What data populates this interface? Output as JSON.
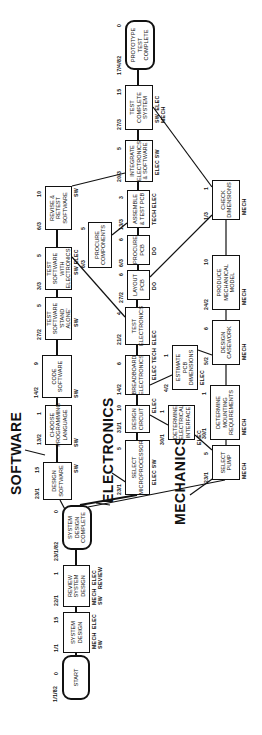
{
  "sections": {
    "software": "SOFTWARE",
    "electronics": "ELECTRONICS",
    "mechanics": "MECHANICS"
  },
  "start_date": "1/1/82",
  "nodes": {
    "start": {
      "label": "START",
      "date": "",
      "duration": "0",
      "resources": ""
    },
    "system_design": {
      "label": "SYSTEM\nDESIGN",
      "date": "1/1",
      "duration": "15",
      "resources": "MECH  ELEC\nSW"
    },
    "review_system_design": {
      "label": "REVIEW\nSYSTEM\nDESIGN",
      "date": "22/1",
      "duration": "1",
      "resources": "MECH  ELEC\nSW    REVIEW"
    },
    "system_design_complete": {
      "label": "SYSTEM\nDESIGN\nCOMPLETE",
      "date": "23/1/82",
      "duration": "0",
      "resources": ""
    },
    "design_software": {
      "label": "DESIGN\nSOFTWARE",
      "date": "23/1",
      "duration": "15",
      "resources": "SW"
    },
    "choose_language": {
      "label": "CHOOSE\nPROGRAMMING\nLANGUAGE",
      "date": "13/2",
      "duration": "1",
      "resources": "SW"
    },
    "code_software": {
      "label": "CODE\nSOFTWARE",
      "date": "14/2",
      "duration": "9",
      "resources": "SW"
    },
    "test_software_standalone": {
      "label": "TEST\nSOFTWARE\n'STAND ALONE'",
      "date": "27/2",
      "duration": "5",
      "resources": "SW"
    },
    "test_software_electronics": {
      "label": "TEST SOFTWARE\nWITH\nELECTRONICS",
      "date": "3/3",
      "duration": "5",
      "resources": "SW  ELEC"
    },
    "revise_retest_software": {
      "label": "REVISE &\nRETEST\nSOFTWARE",
      "date": "6/3",
      "duration": "10",
      "resources": "SW"
    },
    "select_microprocessor": {
      "label": "SELECT\nMICROPROCESSOR",
      "date": "23/1",
      "duration": "5",
      "resources": "ELEC   SW"
    },
    "design_circuit": {
      "label": "DESIGN\nCIRCUIT",
      "date": "31/1",
      "duration": "10",
      "resources": "ELEC"
    },
    "breadboard_electronics": {
      "label": "BREADBOARD\nELECTRONICS",
      "date": "14/2",
      "duration": "6",
      "resources": "ELEC  TECH"
    },
    "test_electronics": {
      "label": "TEST\nELECTRONICS",
      "date": "21/2",
      "duration": "4",
      "resources": "ELEC"
    },
    "layout_pcb": {
      "label": "LAYOUT\nPCB",
      "date": "27/2",
      "duration": "6",
      "resources": "DO"
    },
    "procure_pcb": {
      "label": "PROCURE\nPCB",
      "date": "6/3",
      "duration": "6",
      "resources": "DO"
    },
    "assemble_test_pcb": {
      "label": "ASSEMBLE\n& TEST PCB",
      "date": "13/3",
      "duration": "3",
      "resources": "TECH  ELEC"
    },
    "integrate": {
      "label": "INTEGRATE\nELECTRONICS\n& SOFTWARE",
      "date": "20/3",
      "duration": "5",
      "resources": "ELEC  SW"
    },
    "test_complete_system": {
      "label": "TEST\nCOMPLETE\nSYSTEM",
      "date": "27/3",
      "duration": "15",
      "resources": "SW  ELEC\nMECH"
    },
    "prototype_complete": {
      "label": "PROTOTYPE\nTEST\nCOMPLETE",
      "date": "17/4/82",
      "duration": "0",
      "resources": ""
    },
    "procure_components": {
      "label": "PROCURE\nCOMPONENTS",
      "date": "6/3",
      "duration": "5",
      "resources": "ELEC  TECH"
    },
    "determine_electrical_interface": {
      "label": "DETERMINE\nELECTRICAL\nINTERFACE",
      "date": "30/1",
      "duration": "1",
      "resources": "ELEC"
    },
    "estimate_pcb_dimensions": {
      "label": "ESTIMATE\nPCB\nDIMENSIONS",
      "date": "4/2",
      "duration": "1",
      "resources": "ELEC"
    },
    "select_pump": {
      "label": "SELECT\nPUMP",
      "date": "23/1",
      "duration": "5",
      "resources": "MECH"
    },
    "determine_mounting": {
      "label": "DETERMINE\nMOUNTING\nREQUIREMENTS",
      "date": "30/1",
      "duration": "1",
      "resources": "MECH"
    },
    "design_casework": {
      "label": "DESIGN\nCASEWORK",
      "date": "5/2",
      "duration": "6",
      "resources": "MECH"
    },
    "produce_mechanical_model": {
      "label": "PRODUCE\nMECHANICAL\nMODEL",
      "date": "24/2",
      "duration": "10",
      "resources": "MECH"
    },
    "check_dimensions": {
      "label": "CHECK\nDIMENSIONS",
      "date": "1/3",
      "duration": "1",
      "resources": "MECH"
    }
  }
}
